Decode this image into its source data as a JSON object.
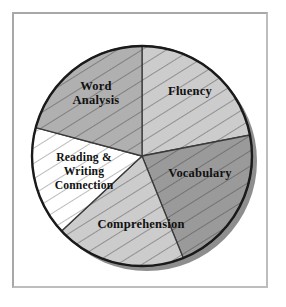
{
  "figure": {
    "background_color": "#ffffff",
    "frame_color": "#a8a8a8"
  },
  "chart_data": {
    "type": "pie",
    "title": "",
    "subtitle": "",
    "xlabel": "",
    "ylabel": "",
    "legend_position": "none",
    "grid": false,
    "labels_inside_slices": true,
    "hatching": "diagonal lines, lower-left to upper-right",
    "outline_color": "#1a1a1a",
    "shadow": true,
    "center": {
      "x": 142,
      "y": 156
    },
    "radius": 110,
    "start_angle_deg": -90,
    "direction": "clockwise",
    "categories": [
      "Fluency",
      "Vocabulary",
      "Comprehension",
      "Reading & Writing Connection",
      "Word Analysis"
    ],
    "values": [
      22,
      22,
      19,
      16,
      21
    ],
    "slices": [
      {
        "label": "Fluency",
        "label_lines": [
          "Fluency"
        ],
        "value": 22,
        "start_angle_deg": -90,
        "end_angle_deg": -11,
        "fill": "#cccccc",
        "label_x": 190,
        "label_y": 92
      },
      {
        "label": "Vocabulary",
        "label_lines": [
          "Vocabulary"
        ],
        "value": 22,
        "start_angle_deg": -11,
        "end_angle_deg": 68,
        "fill": "#9a9a9a",
        "label_x": 200,
        "label_y": 174
      },
      {
        "label": "Comprehension",
        "label_lines": [
          "Comprehension"
        ],
        "value": 19,
        "start_angle_deg": 68,
        "end_angle_deg": 137,
        "fill": "#cccccc",
        "label_x": 141,
        "label_y": 225
      },
      {
        "label": "Reading & Writing Connection",
        "label_lines": [
          "Reading &",
          "Writing",
          "Connection"
        ],
        "value": 16,
        "start_angle_deg": 137,
        "end_angle_deg": 195,
        "fill": "#ffffff",
        "label_x": 84,
        "label_y": 172
      },
      {
        "label": "Word Analysis",
        "label_lines": [
          "Word",
          "Analysis"
        ],
        "value": 21,
        "start_angle_deg": 195,
        "end_angle_deg": 270,
        "fill": "#b0b0b0",
        "label_x": 96,
        "label_y": 94
      }
    ]
  }
}
